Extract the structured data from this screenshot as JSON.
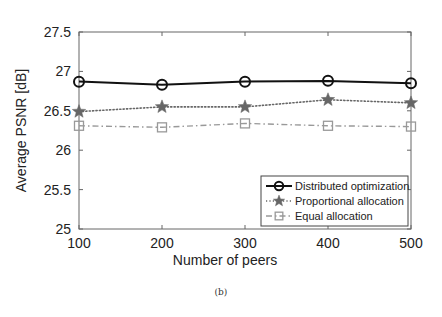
{
  "chart_data": {
    "type": "line",
    "title": "",
    "xlabel": "Number of peers",
    "ylabel": "Average PSNR [dB]",
    "x": [
      100,
      200,
      300,
      400,
      500
    ],
    "xticks": [
      100,
      200,
      300,
      400,
      500
    ],
    "xtick_labels": [
      "100",
      "200",
      "300",
      "400",
      "500"
    ],
    "yticks": [
      25,
      25.5,
      26,
      26.5,
      27,
      27.5
    ],
    "ytick_labels": [
      "25",
      "25.5",
      "26",
      "26.5",
      "27",
      "27.5"
    ],
    "xlim": [
      100,
      500
    ],
    "ylim": [
      25,
      27.5
    ],
    "grid": false,
    "legend_position": "lower right",
    "series": [
      {
        "name": "Distributed optimization",
        "values": [
          26.87,
          26.83,
          26.87,
          26.88,
          26.85
        ],
        "color": "#111111",
        "line_style": "solid",
        "marker": "circle"
      },
      {
        "name": "Proportional allocation",
        "values": [
          26.49,
          26.55,
          26.55,
          26.64,
          26.6
        ],
        "color": "#666666",
        "line_style": "dotted",
        "marker": "star"
      },
      {
        "name": "Equal allocation",
        "values": [
          26.31,
          26.29,
          26.34,
          26.31,
          26.3
        ],
        "color": "#999999",
        "line_style": "dash-dot",
        "marker": "square"
      }
    ]
  },
  "figure": {
    "caption": "(b)"
  }
}
